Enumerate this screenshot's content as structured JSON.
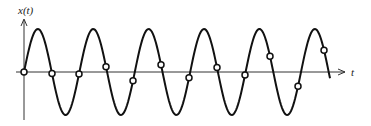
{
  "figure": {
    "y_axis_label": "x(t)",
    "x_axis_label": "t",
    "curve": {
      "type": "sinusoid",
      "amplitude_px": 43,
      "period_px": 55.4,
      "origin": [
        24,
        72
      ],
      "end_x": 330
    },
    "sample_points": [
      [
        24,
        72
      ],
      [
        52,
        70
      ],
      [
        79,
        75
      ],
      [
        106,
        65
      ],
      [
        133,
        83
      ],
      [
        161,
        60
      ],
      [
        189,
        87
      ],
      [
        217,
        55
      ],
      [
        245,
        92
      ],
      [
        270,
        52
      ],
      [
        298,
        92
      ],
      [
        324,
        47
      ]
    ],
    "colors": {
      "curve": "#111111",
      "axis": "#333333",
      "marker_fill": "#ffffff"
    }
  }
}
